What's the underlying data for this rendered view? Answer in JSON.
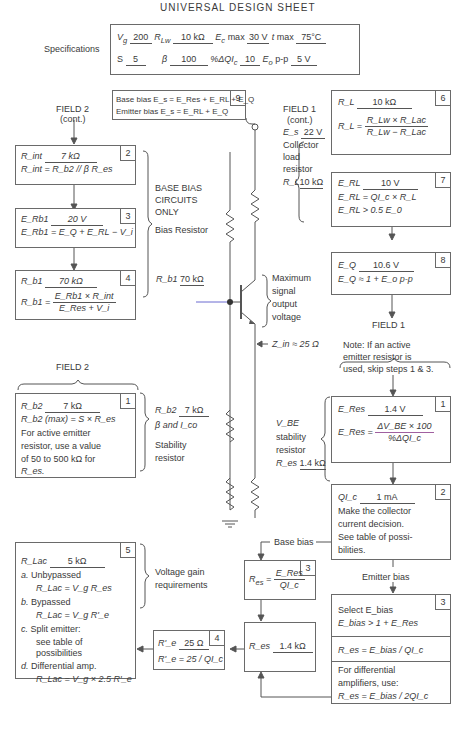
{
  "title": "UNIVERSAL DESIGN SHEET",
  "specifications": {
    "label": "Specifications",
    "row1": {
      "vg_label": "V",
      "vg_sub": "g",
      "vg_value": "200",
      "rlw_label": "R",
      "rlw_sub": "Lw",
      "rlw_value": "10 kΩ",
      "ec_label": "E",
      "ec_sub": "c",
      "ec_suffix": "max",
      "ec_value": "30 V",
      "t_label": "t",
      "t_suffix": "max",
      "t_value": "75°C"
    },
    "row2": {
      "s_label": "S",
      "s_value": "5",
      "beta_label": "β",
      "beta_value": "100",
      "dqic_label": "%ΔQI",
      "dqic_sub": "c",
      "dqic_value": "10",
      "eo_label": "E",
      "eo_sub": "o",
      "eo_suffix": "p-p",
      "eo_value": "5 V"
    }
  },
  "box9": {
    "number": "9",
    "line1": "Base bias E_s = E_Res + E_RL + E_Q",
    "line2": "Emitter bias E_s = E_RL + E_Q"
  },
  "field2_cont": {
    "title": "FIELD 2",
    "subtitle": "(cont.)"
  },
  "field1_cont": {
    "title": "FIELD 1",
    "subtitle": "(cont.)"
  },
  "box2_rint": {
    "number": "2",
    "value_label": "R_int",
    "value": "7 kΩ",
    "formula": "R_int = R_b2 // β R_es"
  },
  "box3_erb1": {
    "number": "3",
    "value_label": "E_Rb1",
    "value": "20 V",
    "formula": "E_Rb1 = E_Q + E_RL − V_i"
  },
  "box4_rb1": {
    "number": "4",
    "value_label": "R_b1",
    "value": "70 kΩ",
    "formula_num": "E_Rb1 × R_int",
    "formula_den": "E_Res + V_i"
  },
  "base_bias_label": [
    "BASE BIAS",
    "CIRCUITS",
    "ONLY"
  ],
  "bias_resistor_label": "Bias Resistor",
  "rb1_annotation": {
    "label": "R_b1",
    "value": "70 kΩ"
  },
  "collector_load": {
    "es_label": "E_s",
    "es_value": "22 V",
    "lines": [
      "Collector",
      "load",
      "resistor"
    ],
    "rl_label": "R_L",
    "rl_value": "10 kΩ"
  },
  "box6_rl": {
    "number": "6",
    "value_label": "R_L",
    "value": "10 kΩ",
    "formula_num": "R_Lw × R_Lac",
    "formula_den": "R_Lw − R_Lac"
  },
  "box7_erl": {
    "number": "7",
    "value_label": "E_RL",
    "value": "10 V",
    "formula1": "E_RL = QI_c × R_L",
    "formula2": "E_RL > 0.5 E_0"
  },
  "box8_eq": {
    "number": "8",
    "value_label": "E_Q",
    "value": "10.6 V",
    "formula": "E_Q ≈ 1 + E_o p-p"
  },
  "max_signal_label": [
    "Maximum",
    "signal",
    "output",
    "voltage"
  ],
  "zin_label": "Z_in ≈ 25 Ω",
  "field1": {
    "title": "FIELD 1",
    "note": [
      "Note: If an active",
      "emitter resistor is",
      "used, skip steps 1 & 3."
    ]
  },
  "field2": {
    "title": "FIELD 2"
  },
  "box1_rb2": {
    "number": "1",
    "value_label": "R_b2",
    "value": "7 kΩ",
    "formula": "R_b2 (max) = S × R_es",
    "note": [
      "For active emitter",
      "resistor, use a value",
      "of 50 to 500 kΩ for",
      "R_es."
    ]
  },
  "stability_annotation": {
    "label": "R_b2",
    "value": "7 kΩ",
    "line2": "β and I_co",
    "lines": [
      "Stability",
      "resistor"
    ]
  },
  "box1_eres": {
    "number": "1",
    "value_label": "E_Res",
    "value": "1.4 V",
    "formula_num": "ΔV_BE × 100",
    "formula_den": "%ΔQI_c"
  },
  "vbe_annotation": {
    "lines": [
      "V_BE",
      "stability",
      "resistor"
    ],
    "label": "R_es",
    "value": "1.4 kΩ"
  },
  "box2_qic": {
    "number": "2",
    "value_label": "QI_c",
    "value": "1 mA",
    "note": [
      "Make the collector",
      "current decision.",
      "See table of possi-",
      "bilities."
    ]
  },
  "base_bias_branch": "Base bias",
  "emitter_bias_branch": "Emitter bias",
  "box3_res": {
    "number": "3",
    "formula_num": "E_Res",
    "formula_den": "QI_c"
  },
  "box3_ebias": {
    "number": "3",
    "line1": "Select E_bias",
    "line2": "E_bias > 1 + E_Res",
    "section2": "R_es = E_bias / QI_c",
    "section3": [
      "For differential",
      "amplifiers, use:",
      "R_es = E_bias / 2QI_c"
    ]
  },
  "res_value_box": {
    "label": "R_es",
    "value": "1.4 kΩ"
  },
  "box4_re": {
    "number": "4",
    "value_label": "R'_e",
    "value": "25 Ω",
    "formula": "R'_e = 25 / QI_c"
  },
  "box5_rlac": {
    "number": "5",
    "value_label": "R_Lac",
    "value": "5 kΩ",
    "items": [
      {
        "letter": "a.",
        "label": "Unbypassed",
        "formula": "R_Lac = V_g R_es"
      },
      {
        "letter": "b.",
        "label": "Bypassed",
        "formula": "R_Lac = V_g R'_e"
      },
      {
        "letter": "c.",
        "label": "Split emitter:",
        "formula": "see table of possibilities"
      },
      {
        "letter": "d.",
        "label": "Differential amp.",
        "formula": "R_Lac = V_g × 2.5 R'_e"
      }
    ]
  },
  "voltage_gain_label": [
    "Voltage gain",
    "requirements"
  ]
}
